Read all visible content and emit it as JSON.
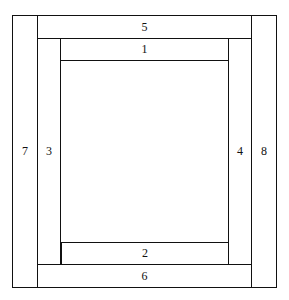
{
  "diagram": {
    "center": {
      "label": ""
    },
    "strips": [
      {
        "id": "1",
        "label": "1",
        "position": "top-inner"
      },
      {
        "id": "2",
        "label": "2",
        "position": "bottom-inner"
      },
      {
        "id": "3",
        "label": "3",
        "position": "left-inner"
      },
      {
        "id": "4",
        "label": "4",
        "position": "right-inner"
      },
      {
        "id": "5",
        "label": "5",
        "position": "top-outer"
      },
      {
        "id": "6",
        "label": "6",
        "position": "bottom-outer"
      },
      {
        "id": "7",
        "label": "7",
        "position": "left-outer"
      },
      {
        "id": "8",
        "label": "8",
        "position": "right-outer"
      }
    ]
  }
}
